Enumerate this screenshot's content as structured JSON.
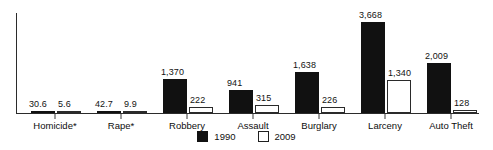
{
  "chart_data": {
    "type": "bar",
    "title": "",
    "subtitle": "",
    "xlabel": "",
    "ylabel": "",
    "grid": false,
    "legend_position": "bottom-center",
    "axis_visible": {
      "x": true,
      "y": true
    },
    "ylim": [
      0,
      4030
    ],
    "categories": [
      "Homicide*",
      "Rape*",
      "Robbery",
      "Assault",
      "Burglary",
      "Larceny",
      "Auto Theft"
    ],
    "series": [
      {
        "name": "1990",
        "color": "#111111",
        "style": "filled",
        "values": [
          30.6,
          42.7,
          1370,
          941,
          1638,
          3668,
          2009
        ],
        "labels": [
          "30.6",
          "42.7",
          "1,370",
          "941",
          "1,638",
          "3,668",
          "2,009"
        ]
      },
      {
        "name": "2009",
        "color": "#ffffff",
        "style": "hollow",
        "values": [
          5.6,
          9.9,
          222,
          315,
          226,
          1340,
          128
        ],
        "labels": [
          "5.6",
          "9.9",
          "222",
          "315",
          "226",
          "1,340",
          "128"
        ]
      }
    ]
  },
  "legend": {
    "items": [
      {
        "label": "1990",
        "style": "filled"
      },
      {
        "label": "2009",
        "style": "hollow"
      }
    ]
  }
}
